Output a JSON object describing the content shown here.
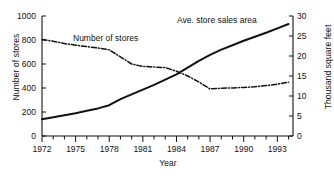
{
  "chart_data": {
    "type": "line",
    "title": "",
    "subtitle": "",
    "xlabel": "Year",
    "ylabel": "Number of stores",
    "ylabel_right": "Thousand square feet",
    "xlim": [
      1972,
      1994.4
    ],
    "ylim": [
      0,
      1000
    ],
    "ylim_right": [
      0,
      30
    ],
    "grid": false,
    "legend_position": "inline-annotations",
    "xticks": [
      1972,
      1975,
      1978,
      1981,
      1984,
      1987,
      1990,
      1993
    ],
    "xtick_labels": [
      "1972",
      "1975",
      "1978",
      "1981",
      "1984",
      "1987",
      "1990",
      "1993"
    ],
    "xminor_tick_interval": 1,
    "yticks_left": [
      0,
      200,
      400,
      600,
      800,
      1000
    ],
    "ytick_labels_left": [
      "0",
      "200",
      "400",
      "600",
      "800",
      "1000"
    ],
    "yticks_right": [
      0,
      5,
      10,
      15,
      20,
      25,
      30
    ],
    "ytick_labels_right": [
      "0",
      "5",
      "10",
      "15",
      "20",
      "25",
      "30"
    ],
    "x": [
      1972,
      1973,
      1974,
      1975,
      1976,
      1977,
      1978,
      1979,
      1980,
      1981,
      1982,
      1983,
      1984,
      1985,
      1986,
      1987,
      1988,
      1989,
      1990,
      1991,
      1992,
      1993,
      1994
    ],
    "series": [
      {
        "name": "Number of stores",
        "axis": "left",
        "style": "dash-dot",
        "color": "#111111",
        "annotation": "Number of stores",
        "values": [
          805,
          790,
          770,
          757,
          745,
          733,
          718,
          660,
          600,
          580,
          575,
          570,
          540,
          500,
          450,
          392,
          398,
          400,
          405,
          410,
          420,
          432,
          448
        ]
      },
      {
        "name": "Ave. store sales area",
        "axis": "right",
        "style": "solid",
        "color": "#111111",
        "annotation": "Ave. store sales area",
        "values": [
          4.2,
          4.7,
          5.2,
          5.7,
          6.3,
          6.9,
          7.7,
          9.2,
          10.4,
          11.6,
          12.8,
          14.1,
          15.4,
          17.1,
          18.8,
          20.3,
          21.6,
          22.7,
          23.8,
          24.8,
          25.8,
          26.9,
          28.0
        ]
      }
    ]
  }
}
